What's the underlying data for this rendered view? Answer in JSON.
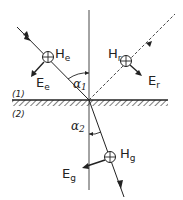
{
  "diagram": {
    "media": [
      {
        "id": "1",
        "label": "(1)"
      },
      {
        "id": "2",
        "label": "(2)"
      }
    ],
    "waves": {
      "incident": {
        "H_label": "H",
        "H_sub": "e",
        "E_label": "E",
        "E_sub": "e"
      },
      "reflected": {
        "H_label": "H",
        "H_sub": "r",
        "E_label": "E",
        "E_sub": "r"
      },
      "refracted": {
        "H_label": "H",
        "H_sub": "g",
        "E_label": "E",
        "E_sub": "g"
      }
    },
    "angles": {
      "incidence": {
        "symbol": "α",
        "sub": "1"
      },
      "refraction": {
        "symbol": "α",
        "sub": "2"
      }
    },
    "colors": {
      "ink": "#222222",
      "background": "#ffffff"
    }
  }
}
